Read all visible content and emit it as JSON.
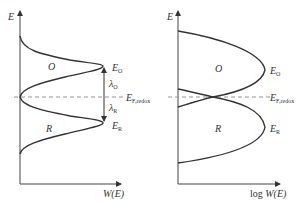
{
  "left_panel": {
    "y_axis_label": "E",
    "x_axis_label": "W(E)",
    "region_oxidized": "O",
    "region_reduced": "R",
    "level_oxidized": {
      "main": "E",
      "sub": "O"
    },
    "level_reduced": {
      "main": "E",
      "sub": "R"
    },
    "lambda_oxidized": {
      "main": "λ",
      "sub": "O"
    },
    "lambda_reduced": {
      "main": "λ",
      "sub": "R"
    },
    "fermi_level": {
      "main": "E",
      "sub": "F,redox"
    }
  },
  "right_panel": {
    "y_axis_label": "E",
    "x_axis_label_prefix": "log ",
    "x_axis_label": "W(E)",
    "region_oxidized": "O",
    "region_reduced": "R",
    "level_oxidized": {
      "main": "E",
      "sub": "O"
    },
    "level_reduced": {
      "main": "E",
      "sub": "R"
    },
    "fermi_level": {
      "main": "E",
      "sub": "F,redox"
    }
  },
  "colors": {
    "curve": "#333333",
    "axis": "#444444",
    "dashed": "#888888"
  }
}
